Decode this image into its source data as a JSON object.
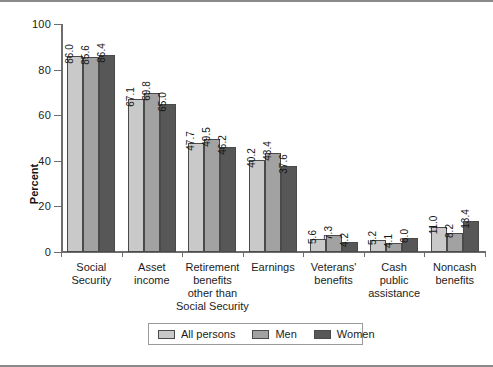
{
  "chart_data": {
    "type": "bar",
    "title": "",
    "xlabel": "",
    "ylabel": "Percent",
    "ylim": [
      0,
      100
    ],
    "yticks": [
      0,
      20,
      40,
      60,
      80,
      100
    ],
    "grid": false,
    "legend_position": "bottom-center",
    "categories": [
      "Social\nSecurity",
      "Asset\nincome",
      "Retirement\nbenefits\nother than\nSocial Security",
      "Earnings",
      "Veterans'\nbenefits",
      "Cash\npublic\nassistance",
      "Noncash\nbenefits"
    ],
    "series": [
      {
        "name": "All persons",
        "color": "#c9c9c9",
        "values": [
          86.0,
          67.1,
          47.7,
          40.2,
          5.6,
          5.2,
          11.0
        ]
      },
      {
        "name": "Men",
        "color": "#a2a2a2",
        "values": [
          85.6,
          69.8,
          49.5,
          43.4,
          7.3,
          4.1,
          8.2
        ]
      },
      {
        "name": "Women",
        "color": "#575757",
        "values": [
          86.4,
          65.0,
          46.2,
          37.6,
          4.2,
          6.0,
          13.4
        ]
      }
    ],
    "value_labels": [
      [
        "86.0",
        "85.6",
        "86.4"
      ],
      [
        "67.1",
        "69.8",
        "65.0"
      ],
      [
        "47.7",
        "49.5",
        "46.2"
      ],
      [
        "40.2",
        "43.4",
        "37.6"
      ],
      [
        "5.6",
        "7.3",
        "4.2"
      ],
      [
        "5.2",
        "4.1",
        "6.0"
      ],
      [
        "11.0",
        "8.2",
        "13.4"
      ]
    ],
    "ytick_labels": [
      "0",
      "20",
      "40",
      "60",
      "80",
      "100"
    ]
  }
}
